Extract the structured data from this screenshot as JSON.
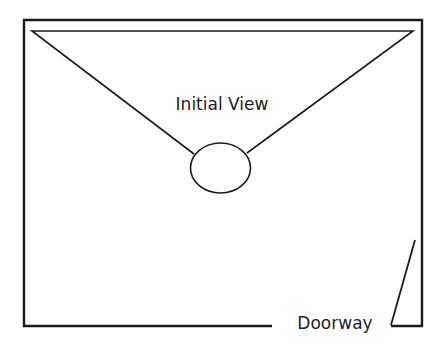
{
  "diagram": {
    "type": "room-floor-plan",
    "colors": {
      "stroke": "#1a1a1a",
      "background": "#ffffff",
      "text": "#222222"
    },
    "labels": {
      "view_cone": "Initial View",
      "door": "Doorway"
    },
    "room": {
      "left": 24,
      "top": 20,
      "right": 422,
      "bottom": 326,
      "wall_gap_start": 272,
      "wall_gap_end": 391
    },
    "viewer": {
      "cx": 220,
      "cy": 168,
      "rx": 30,
      "ry": 25
    },
    "view_cone": {
      "apex_left": [
        194,
        154
      ],
      "apex_right": [
        247,
        153
      ],
      "far_left": [
        32,
        31
      ],
      "far_right": [
        413,
        31
      ]
    },
    "door": {
      "hinge": [
        391,
        325
      ],
      "open_edge": [
        415,
        240
      ],
      "wall_end": [
        422,
        325
      ]
    }
  }
}
